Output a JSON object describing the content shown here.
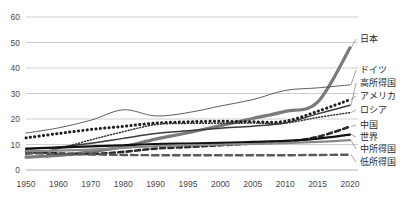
{
  "chart_data": {
    "type": "line",
    "title": "",
    "xlabel": "",
    "ylabel": "",
    "ylim": [
      0,
      60
    ],
    "yticks": [
      0,
      10,
      20,
      30,
      40,
      50,
      60
    ],
    "xticks": [
      "1950",
      "1960",
      "1970",
      "1980",
      "1990",
      "1995",
      "2000",
      "2005",
      "2010",
      "2015",
      "2020"
    ],
    "x": [
      1950,
      1960,
      1970,
      1980,
      1990,
      1995,
      2000,
      2005,
      2010,
      2015,
      2020
    ],
    "grid": true,
    "legend_position": "right-inline",
    "series": [
      {
        "name": "日本",
        "label": "日本",
        "color": "#7a7a7a",
        "style": "solid-thick",
        "stroke_width": 3.2,
        "values": [
          5.0,
          5.7,
          7.1,
          9.1,
          12.1,
          14.6,
          17.4,
          20.2,
          23.0,
          26.6,
          28.6
        ],
        "end_value": 47.9,
        "label_value": 47.9
      },
      {
        "name": "ドイツ",
        "label": "ドイツ",
        "color": "#4d4d4d",
        "style": "solid-thin",
        "stroke_width": 0.9,
        "values": [
          14.5,
          16.5,
          19.5,
          23.6,
          21.2,
          22.5,
          25.1,
          27.6,
          31.2,
          32.2,
          33.4
        ],
        "end_value": 33.4,
        "label_value": 33.4
      },
      {
        "name": "高所得国",
        "label": "高所得国",
        "color": "#3a3a3a",
        "style": "solid-medium",
        "stroke_width": 1.5,
        "values": [
          8.2,
          9.0,
          10.5,
          12.4,
          14.3,
          15.4,
          16.4,
          17.2,
          18.4,
          22.0,
          25.4
        ],
        "end_value": 25.4,
        "label_value": 25.4
      },
      {
        "name": "アメリカ",
        "label": "アメリカ",
        "color": "#1f1f1f",
        "style": "dotted-square",
        "stroke_width": 3.0,
        "values": [
          12.6,
          14.3,
          15.9,
          17.1,
          18.4,
          18.9,
          19.1,
          18.9,
          19.1,
          23.0,
          27.6
        ],
        "end_value": 27.6,
        "label_value": 27.6
      },
      {
        "name": "ロシア",
        "label": "ロシア",
        "color": "#333333",
        "style": "dotted-fine",
        "stroke_width": 1.5,
        "values": [
          6.0,
          8.4,
          11.8,
          15.0,
          17.8,
          18.3,
          18.3,
          18.4,
          18.4,
          20.6,
          22.5
        ],
        "end_value": 22.5,
        "label_value": 22.5
      },
      {
        "name": "中国",
        "label": "中国",
        "color": "#2a2a2a",
        "style": "dashed-thick",
        "stroke_width": 2.6,
        "values": [
          7.3,
          6.5,
          6.3,
          7.1,
          8.4,
          9.0,
          9.7,
          10.4,
          11.0,
          13.0,
          17.0
        ],
        "end_value": 17.0,
        "label_value": 17.0
      },
      {
        "name": "世界",
        "label": "世界",
        "color": "#111111",
        "style": "solid-bold",
        "stroke_width": 2.2,
        "values": [
          8.4,
          8.8,
          9.3,
          9.7,
          10.2,
          10.4,
          10.6,
          11.0,
          11.4,
          12.3,
          13.9
        ],
        "end_value": 13.9,
        "label_value": 13.9
      },
      {
        "name": "中所得国",
        "label": "中所得国",
        "color": "#8a8a8a",
        "style": "solid-grayband",
        "stroke_width": 2.2,
        "values": [
          7.4,
          7.6,
          8.0,
          8.7,
          9.4,
          9.7,
          9.9,
          10.2,
          10.5,
          11.0,
          11.7
        ],
        "end_value": 11.7,
        "label_value": 11.7
      },
      {
        "name": "低所得国",
        "label": "低所得国",
        "color": "#5a5a5a",
        "style": "dashed-long",
        "stroke_width": 2.4,
        "values": [
          6.6,
          6.3,
          6.1,
          5.9,
          5.8,
          5.8,
          5.8,
          5.8,
          5.8,
          5.9,
          6.0
        ],
        "end_value": 6.0,
        "label_value": 6.0
      }
    ]
  },
  "axes": {
    "y_tick_labels": [
      "60",
      "50",
      "40",
      "30",
      "20",
      "10",
      "0"
    ],
    "x_tick_labels": [
      "1950",
      "1960",
      "1970",
      "1980",
      "1990",
      "1995",
      "2000",
      "2005",
      "2010",
      "2015",
      "2020"
    ]
  },
  "legend": {
    "items": [
      {
        "label": "日本"
      },
      {
        "label": "ドイツ"
      },
      {
        "label": "高所得国"
      },
      {
        "label": "アメリカ"
      },
      {
        "label": "ロシア"
      },
      {
        "label": "中国"
      },
      {
        "label": "世界"
      },
      {
        "label": "中所得国"
      },
      {
        "label": "低所得国"
      }
    ]
  },
  "colors": {
    "grid": "#b9b9b9",
    "text": "#4a4a4a",
    "background": "#ffffff"
  }
}
